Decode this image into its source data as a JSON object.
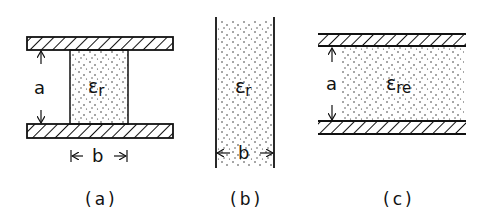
{
  "figure": {
    "panels": [
      {
        "id": "a",
        "caption": "(a)",
        "dielectric_label": "ε",
        "dielectric_sub": "r",
        "height_label": "a",
        "width_label": "b",
        "description": "Parallel plates with finite-width dielectric block between them"
      },
      {
        "id": "b",
        "caption": "(b)",
        "dielectric_label": "ε",
        "dielectric_sub": "r",
        "width_label": "b",
        "description": "Dielectric slab of width b between two lines"
      },
      {
        "id": "c",
        "caption": "(c)",
        "dielectric_label": "ε",
        "dielectric_sub": "re",
        "height_label": "a",
        "description": "Parallel plates fully filled with effective dielectric"
      }
    ],
    "colors": {
      "ink": "#111111",
      "background": "#ffffff"
    }
  }
}
